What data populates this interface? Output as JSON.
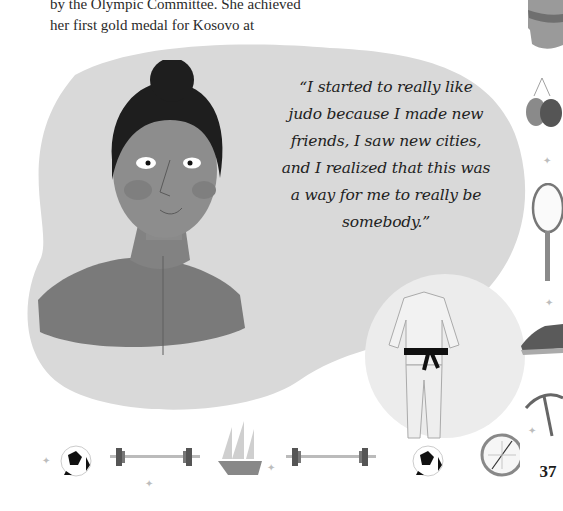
{
  "page": {
    "body_text_lines": [
      "by the Olympic Committee. She achieved",
      "her first gold medal for Kosovo at"
    ],
    "quote_lines": [
      "“I started to really like",
      "judo because I made new",
      "friends, I saw new cities,",
      "and I realized that this was",
      "a way for me to really be",
      "somebody.”"
    ],
    "page_number": "37"
  },
  "illustrations": {
    "portrait": "woman-with-hair-bun-portrait",
    "judogi": "judo-uniform-with-black-belt",
    "side_icons": [
      "leotard-icon",
      "boxing-gloves-icon",
      "racket-icon",
      "sneaker-icon",
      "ice-axe-icon"
    ],
    "bottom_row": [
      "soccer-ball-icon",
      "barbell-icon",
      "sailing-ship-icon",
      "barbell-icon",
      "soccer-ball-icon",
      "compass-icon"
    ]
  },
  "colors": {
    "blob": "#d9d9d9",
    "small_blob": "#ececec",
    "skin": "#8d8d8d",
    "shirt": "#7a7a7a",
    "hair": "#1e1e1e"
  }
}
